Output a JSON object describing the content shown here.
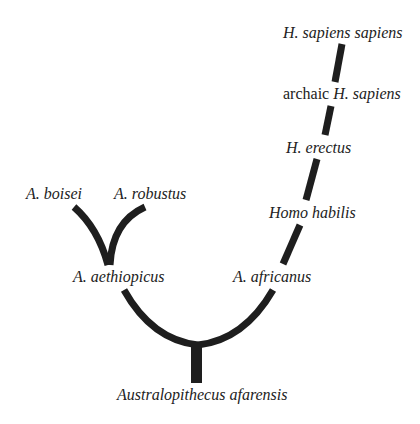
{
  "diagram": {
    "type": "phylogenetic-tree",
    "line_color": "#1e1e1e",
    "background": "#ffffff",
    "labels": {
      "sapiens_sapiens": "H. sapiens sapiens",
      "archaic_prefix": "archaic ",
      "archaic_species": "H. sapiens",
      "erectus": "H. erectus",
      "habilis": "Homo habilis",
      "africanus": "A. africanus",
      "boisei": "A. boisei",
      "robustus": "A. robustus",
      "aethiopicus": "A. aethiopicus",
      "afarensis": "Australopithecus afarensis"
    }
  }
}
